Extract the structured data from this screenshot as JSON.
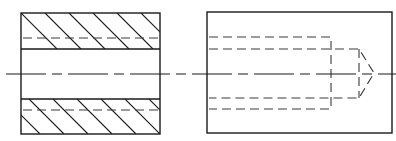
{
  "drawing": {
    "title": "",
    "colors": {
      "line": "#1a1a1a",
      "hidden_line": "#3a3a3a",
      "background": "#ffffff"
    },
    "views": [
      {
        "name": "sectioned-view",
        "type": "section",
        "outline": {
          "x": 21,
          "y": 13,
          "w": 139,
          "h": 121
        },
        "bore_lines_y": [
          49,
          99
        ],
        "hidden_lines_y": [
          38,
          110
        ],
        "hatch": {
          "angle_deg": 45,
          "spacing": 24
        }
      },
      {
        "name": "external-view",
        "type": "exterior",
        "outline": {
          "x": 207,
          "y": 12,
          "w": 185,
          "h": 121
        },
        "counterbore": {
          "top_y": 37,
          "bottom_y": 109,
          "end_x": 331
        },
        "drill": {
          "top_y": 49,
          "bottom_y": 98,
          "end_x": 359,
          "tip_x": 374,
          "tip_y": 73
        }
      }
    ],
    "centerline": {
      "y": 74,
      "x1": 6,
      "x2": 396
    }
  }
}
